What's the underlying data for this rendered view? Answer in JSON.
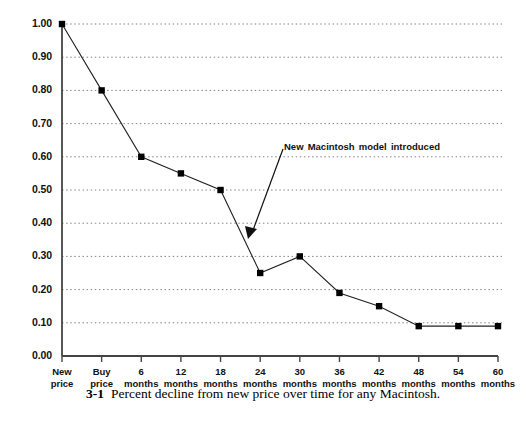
{
  "chart_data": {
    "type": "line",
    "title": "",
    "xlabel": "",
    "ylabel": "",
    "ylim": [
      0.0,
      1.0
    ],
    "ytick_step": 0.1,
    "grid": true,
    "legend": "none",
    "categories": [
      "New price",
      "Buy price",
      "6 months",
      "12 months",
      "18 months",
      "24 months",
      "30 months",
      "36 months",
      "42 months",
      "48 months",
      "54 months",
      "60 months"
    ],
    "values": [
      1.0,
      0.8,
      0.6,
      0.55,
      0.5,
      0.25,
      0.3,
      0.19,
      0.15,
      0.09,
      0.09,
      0.09
    ],
    "ytick_labels": [
      "0.00",
      "0.10",
      "0.20",
      "0.30",
      "0.40",
      "0.50",
      "0.60",
      "0.70",
      "0.80",
      "0.90",
      "1.00"
    ],
    "xtick_labels": [
      {
        "line1": "New",
        "line2": "price"
      },
      {
        "line1": "Buy",
        "line2": "price"
      },
      {
        "line1": "6",
        "line2": "months"
      },
      {
        "line1": "12",
        "line2": "months"
      },
      {
        "line1": "18",
        "line2": "months"
      },
      {
        "line1": "24",
        "line2": "months"
      },
      {
        "line1": "30",
        "line2": "months"
      },
      {
        "line1": "36",
        "line2": "months"
      },
      {
        "line1": "42",
        "line2": "months"
      },
      {
        "line1": "48",
        "line2": "months"
      },
      {
        "line1": "54",
        "line2": "months"
      },
      {
        "line1": "60",
        "line2": "months"
      }
    ],
    "annotations": [
      {
        "text": "New Macintosh model introduced",
        "points_to_category": "24 months",
        "points_to_value": 0.25
      }
    ],
    "marker": "filled-square",
    "line_color": "#222222",
    "marker_color": "#000000",
    "grid_color": "#777777",
    "axis_color": "#444444"
  },
  "caption": {
    "number": "3-1",
    "text": "Percent decline from new price over time for any Macintosh."
  }
}
